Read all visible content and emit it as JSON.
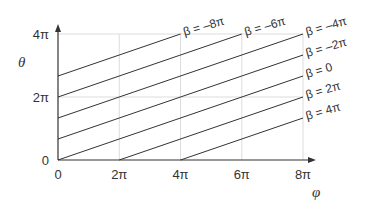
{
  "chart_data": {
    "type": "line",
    "title": "",
    "xlabel": "φ",
    "ylabel": "θ",
    "xlim_pi": [
      0,
      8
    ],
    "ylim_pi": [
      0,
      4
    ],
    "xticks": [
      {
        "value_pi": 0,
        "label": "0"
      },
      {
        "value_pi": 2,
        "label": "2π"
      },
      {
        "value_pi": 4,
        "label": "4π"
      },
      {
        "value_pi": 6,
        "label": "6π"
      },
      {
        "value_pi": 8,
        "label": "8π"
      }
    ],
    "yticks": [
      {
        "value_pi": 0,
        "label": "0"
      },
      {
        "value_pi": 2,
        "label": "2π"
      },
      {
        "value_pi": 4,
        "label": "4π"
      }
    ],
    "grid": true,
    "relation": "θ = (φ − β) / 3",
    "series": [
      {
        "name": "β = –8π",
        "beta_pi": -8
      },
      {
        "name": "β = –6π",
        "beta_pi": -6
      },
      {
        "name": "β = –4π",
        "beta_pi": -4
      },
      {
        "name": "β = –2π",
        "beta_pi": -2
      },
      {
        "name": "β = 0",
        "beta_pi": 0
      },
      {
        "name": "β = 2π",
        "beta_pi": 2
      },
      {
        "name": "β = 4π",
        "beta_pi": 4
      }
    ]
  }
}
